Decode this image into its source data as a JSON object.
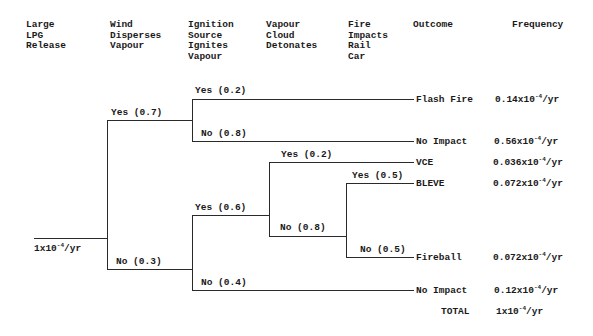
{
  "headers": [
    {
      "id": "initiating",
      "text": "Large\nLPG\nRelease"
    },
    {
      "id": "wind",
      "text": "Wind\nDisperses\nVapour"
    },
    {
      "id": "ignition",
      "text": "Ignition\nSource\nIgnites\nVapour"
    },
    {
      "id": "detonates",
      "text": "Vapour\nCloud\nDetonates"
    },
    {
      "id": "fire_impacts",
      "text": "Fire\nImpacts\nRail\nCar"
    },
    {
      "id": "outcome",
      "text": "Outcome"
    },
    {
      "id": "frequency",
      "text": "Frequency"
    }
  ],
  "initiating_event": {
    "mantissa": "1x10",
    "exp": "-4",
    "unit": "/yr"
  },
  "branches": {
    "wind_yes": "Yes (0.7)",
    "wind_no": "No (0.3)",
    "ign_yes_top": "Yes (0.2)",
    "ign_no_top": "No (0.8)",
    "ign_yes_bottom": "Yes (0.6)",
    "ign_no_bottom": "No (0.4)",
    "det_yes": "Yes (0.2)",
    "det_no": "No (0.8)",
    "fire_yes": "Yes (0.5)",
    "fire_no": "No (0.5)"
  },
  "outcomes": [
    {
      "name": "Flash Fire",
      "mantissa": "0.14x10",
      "exp": "-4",
      "unit": "/yr"
    },
    {
      "name": "No Impact",
      "mantissa": "0.56x10",
      "exp": "-4",
      "unit": "/yr"
    },
    {
      "name": "VCE",
      "mantissa": "0.036x10",
      "exp": "-4",
      "unit": "/yr"
    },
    {
      "name": "BLEVE",
      "mantissa": "0.072x10",
      "exp": "-4",
      "unit": "/yr"
    },
    {
      "name": "Fireball",
      "mantissa": "0.072x10",
      "exp": "-4",
      "unit": "/yr"
    },
    {
      "name": "No Impact",
      "mantissa": "0.12x10",
      "exp": "-4",
      "unit": "/yr"
    }
  ],
  "total": {
    "label": "TOTAL",
    "mantissa": "1x10",
    "exp": "-4",
    "unit": "/yr"
  }
}
